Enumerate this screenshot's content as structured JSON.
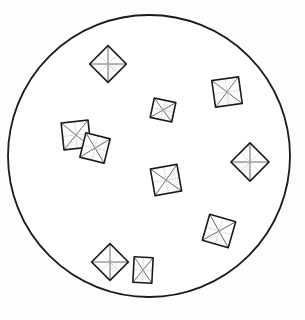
{
  "figure": {
    "background_color": "#fdfdfd",
    "canvas": {
      "width": 305,
      "height": 320
    }
  },
  "field_of_view": {
    "name": "circular-field-boundary",
    "shape": "circle",
    "center_x": 149,
    "center_y": 156,
    "radius": 141,
    "stroke_color": "#1a1a1a",
    "stroke_width": 1.8,
    "fill_color": "#ffffff"
  },
  "style": {
    "outline_color": "#1a1a1a",
    "inner_line_color": "#3a3a3a",
    "shade_color": "#9a9a9a",
    "shade_color_light": "#c4c4c4",
    "crystal_fill": "#ffffff",
    "outline_width": 1.6,
    "inner_width": 0.7
  },
  "crystals": [
    {
      "id": "crystal-1",
      "label": "top-diamond",
      "form": "octahedron-diamond",
      "center_x": 108,
      "center_y": 64,
      "size": 26,
      "rotation": 45,
      "aspect": 1.0
    },
    {
      "id": "crystal-2",
      "label": "upper-right-square",
      "form": "octahedron-square",
      "center_x": 227,
      "center_y": 92,
      "size": 27,
      "rotation": -8,
      "aspect": 1.0
    },
    {
      "id": "crystal-3",
      "label": "upper-center-square",
      "form": "octahedron-square",
      "center_x": 163,
      "center_y": 110,
      "size": 22,
      "rotation": 12,
      "aspect": 0.9
    },
    {
      "id": "crystal-4",
      "label": "left-pair-upper",
      "form": "octahedron-square",
      "center_x": 76,
      "center_y": 135,
      "size": 27,
      "rotation": -6,
      "aspect": 1.0
    },
    {
      "id": "crystal-5",
      "label": "left-pair-lower",
      "form": "octahedron-square",
      "center_x": 95,
      "center_y": 148,
      "size": 25,
      "rotation": 14,
      "aspect": 1.0
    },
    {
      "id": "crystal-6",
      "label": "right-diamond",
      "form": "octahedron-diamond",
      "center_x": 250,
      "center_y": 162,
      "size": 27,
      "rotation": 45,
      "aspect": 1.0
    },
    {
      "id": "crystal-7",
      "label": "center-square",
      "form": "octahedron-square",
      "center_x": 166,
      "center_y": 180,
      "size": 27,
      "rotation": -10,
      "aspect": 1.0
    },
    {
      "id": "crystal-8",
      "label": "lower-right-square",
      "form": "octahedron-square",
      "center_x": 219,
      "center_y": 231,
      "size": 27,
      "rotation": 16,
      "aspect": 1.0
    },
    {
      "id": "crystal-9",
      "label": "bottom-left-diamond",
      "form": "octahedron-diamond",
      "center_x": 110,
      "center_y": 262,
      "size": 26,
      "rotation": 45,
      "aspect": 1.0
    },
    {
      "id": "crystal-10",
      "label": "bottom-small-rectangle",
      "form": "octahedron-rectangle",
      "center_x": 143,
      "center_y": 270,
      "size": 19,
      "rotation": 3,
      "aspect": 1.35
    }
  ],
  "counts": {
    "crystal_count": 10,
    "crystal_count_label": "10"
  }
}
